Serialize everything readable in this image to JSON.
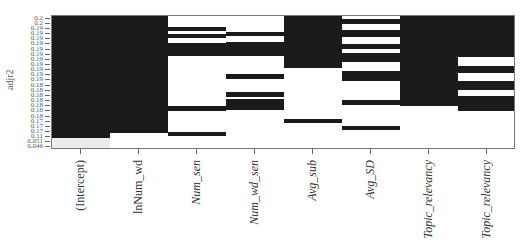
{
  "chart_data": {
    "type": "heatmap",
    "title": "",
    "ylabel": "adjr2",
    "xlabel": "",
    "categories": [
      "(Intercept)",
      "lnNum_wd",
      "Num_sen",
      "Num_wd_sen",
      "Avg_sub",
      "Avg_SD",
      "Topic_relevancy",
      "Topic_relevancy"
    ],
    "y_tick_labels": [
      "0.2",
      "0.2",
      "0.19",
      "0.19",
      "0.19",
      "0.19",
      "0.19",
      "0.19",
      "0.19",
      "0.19",
      "0.19",
      "0.19",
      "0.19",
      "0.18",
      "0.18",
      "0.18",
      "0.18",
      "0.18",
      "0.18",
      "0.18",
      "0.17",
      "0.17",
      "0.17",
      "0.11",
      "0.051",
      "0.046"
    ],
    "cell_colors": {
      "filled": "#1a1a1a",
      "lowest": "#ebebeb",
      "empty": "#ffffff"
    },
    "bars": [
      {
        "col": 0,
        "y0": 0,
        "y1": 122,
        "shade": "dark"
      },
      {
        "col": 0,
        "y0": 122,
        "y1": 134,
        "shade": "gray"
      },
      {
        "col": 1,
        "y0": 0,
        "y1": 117,
        "shade": "dark"
      },
      {
        "col": 2,
        "y0": 11,
        "y1": 15,
        "shade": "dark"
      },
      {
        "col": 2,
        "y0": 18,
        "y1": 22,
        "shade": "dark"
      },
      {
        "col": 2,
        "y0": 27,
        "y1": 40,
        "shade": "dark"
      },
      {
        "col": 2,
        "y0": 90,
        "y1": 95,
        "shade": "dark"
      },
      {
        "col": 2,
        "y0": 116,
        "y1": 120,
        "shade": "dark"
      },
      {
        "col": 3,
        "y0": 16,
        "y1": 20,
        "shade": "dark"
      },
      {
        "col": 3,
        "y0": 26,
        "y1": 40,
        "shade": "dark"
      },
      {
        "col": 3,
        "y0": 58,
        "y1": 63,
        "shade": "dark"
      },
      {
        "col": 3,
        "y0": 76,
        "y1": 81,
        "shade": "dark"
      },
      {
        "col": 3,
        "y0": 83,
        "y1": 94,
        "shade": "dark"
      },
      {
        "col": 4,
        "y0": 0,
        "y1": 52,
        "shade": "dark"
      },
      {
        "col": 4,
        "y0": 103,
        "y1": 107,
        "shade": "dark"
      },
      {
        "col": 5,
        "y0": 3,
        "y1": 8,
        "shade": "dark"
      },
      {
        "col": 5,
        "y0": 14,
        "y1": 21,
        "shade": "dark"
      },
      {
        "col": 5,
        "y0": 28,
        "y1": 33,
        "shade": "dark"
      },
      {
        "col": 5,
        "y0": 37,
        "y1": 46,
        "shade": "dark"
      },
      {
        "col": 5,
        "y0": 55,
        "y1": 65,
        "shade": "dark"
      },
      {
        "col": 5,
        "y0": 84,
        "y1": 89,
        "shade": "dark"
      },
      {
        "col": 5,
        "y0": 110,
        "y1": 114,
        "shade": "dark"
      },
      {
        "col": 6,
        "y0": 0,
        "y1": 90,
        "shade": "dark"
      },
      {
        "col": 7,
        "y0": 0,
        "y1": 41,
        "shade": "dark"
      },
      {
        "col": 7,
        "y0": 50,
        "y1": 57,
        "shade": "dark"
      },
      {
        "col": 7,
        "y0": 65,
        "y1": 74,
        "shade": "dark"
      },
      {
        "col": 7,
        "y0": 80,
        "y1": 95,
        "shade": "dark"
      }
    ],
    "plot_px": {
      "width": 464,
      "height": 134,
      "columns": 8
    }
  }
}
